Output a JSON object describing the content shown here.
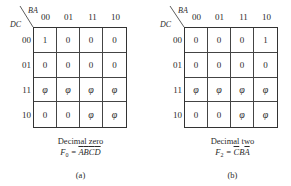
{
  "maps": [
    {
      "id": "a",
      "row_var": "DC",
      "col_var": "BA",
      "col_headers": [
        "00",
        "01",
        "11",
        "10"
      ],
      "row_headers": [
        "00",
        "01",
        "11",
        "10"
      ],
      "cells": [
        [
          "1",
          "0",
          "0",
          "0"
        ],
        [
          "0",
          "0",
          "0",
          "0"
        ],
        [
          "φ",
          "φ",
          "φ",
          "φ"
        ],
        [
          "0",
          "0",
          "φ",
          "φ"
        ]
      ],
      "caption_title": "Decimal zero",
      "formula_lhs": "F",
      "formula_sub": "0",
      "formula_eq": " = ",
      "formula_terms": [
        "A",
        "B",
        "C",
        "D"
      ],
      "formula_overbar": [
        true,
        true,
        true,
        true
      ],
      "label": "(a)"
    },
    {
      "id": "b",
      "row_var": "DC",
      "col_var": "BA",
      "col_headers": [
        "00",
        "01",
        "11",
        "10"
      ],
      "row_headers": [
        "00",
        "01",
        "11",
        "10"
      ],
      "cells": [
        [
          "0",
          "0",
          "0",
          "1"
        ],
        [
          "0",
          "0",
          "0",
          "0"
        ],
        [
          "φ",
          "φ",
          "φ",
          "φ"
        ],
        [
          "0",
          "0",
          "φ",
          "φ"
        ]
      ],
      "caption_title": "Decimal two",
      "formula_lhs": "F",
      "formula_sub": "2",
      "formula_eq": " = ",
      "formula_terms": [
        "C",
        "B",
        "A"
      ],
      "formula_overbar": [
        true,
        false,
        true
      ],
      "label": "(b)"
    }
  ]
}
